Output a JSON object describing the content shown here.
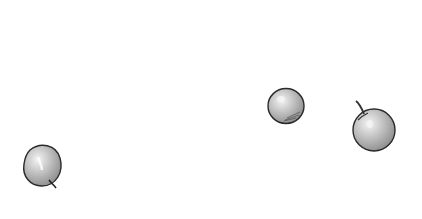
{
  "scene": {
    "description": "Three hand-drawn grayscale apples on a white background",
    "background": "#ffffff",
    "items": [
      {
        "name": "apple-left",
        "stem": "bottom"
      },
      {
        "name": "apple-middle",
        "stem": "none"
      },
      {
        "name": "apple-right",
        "stem": "top"
      }
    ]
  }
}
